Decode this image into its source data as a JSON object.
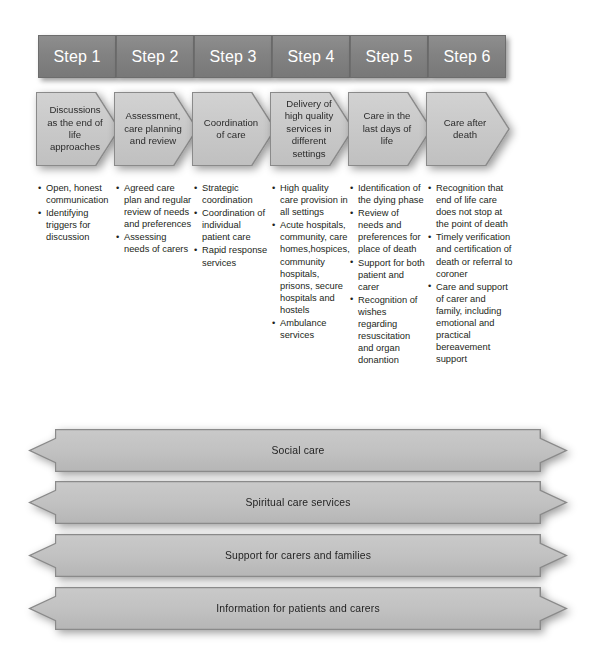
{
  "diagram": {
    "accent_color": "#828282",
    "box_fill_color": "#c6c6c6",
    "box_border_color": "#8a8a8a",
    "header_text_color": "#ffffff",
    "body_text_color": "#231f20"
  },
  "steps": [
    {
      "header": "Step 1",
      "stage": "Discussions as the end of life approaches",
      "bullets": [
        "Open, honest communication",
        "Identifying triggers for discussion"
      ]
    },
    {
      "header": "Step 2",
      "stage": "Assessment, care planning and review",
      "bullets": [
        "Agreed care plan and regular review of needs and preferences",
        "Assessing needs of carers"
      ]
    },
    {
      "header": "Step 3",
      "stage": "Coordination of care",
      "bullets": [
        "Strategic coordination",
        "Coordination of individual patient care",
        "Rapid response services"
      ]
    },
    {
      "header": "Step 4",
      "stage": "Delivery of high quality services in different settings",
      "bullets": [
        "High quality care provision in all settings",
        "Acute hospitals, community, care homes,hospices, community hospitals, prisons, secure hospitals and hostels",
        "Ambulance services"
      ]
    },
    {
      "header": "Step 5",
      "stage": "Care in the last days of life",
      "bullets": [
        "Identification of the dying phase",
        "Review of needs and preferences for place of death",
        "Support for both patient and carer",
        "Recognition of wishes regarding resuscitation and organ donantion"
      ]
    },
    {
      "header": "Step 6",
      "stage": "Care after death",
      "bullets": [
        "Recognition that end of life care does not stop at the point of death",
        "Timely verification and certification of death or referral to coroner",
        "Care and support of carer and family, including emotional and practical bereavement support"
      ]
    }
  ],
  "cross_cutting_bars": [
    {
      "label": "Social care"
    },
    {
      "label": "Spiritual care services"
    },
    {
      "label": "Support for carers and families"
    },
    {
      "label": "Information for patients and carers"
    }
  ],
  "caption": {
    "text": ""
  }
}
